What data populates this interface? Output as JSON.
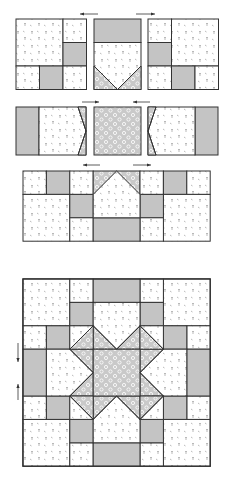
{
  "colors": {
    "background": "#ffffff",
    "line": "#333333",
    "gray_fabric": "#c4c4c4",
    "print_fabric": "#ffffff",
    "print_motif": "#8a8a8a",
    "flower_fabric": "#c9c9c9",
    "flower_motif": "#ffffff"
  },
  "fabrics": {
    "P": "background print (small sprigs on white)",
    "G": "solid gray",
    "F": "gray floral print"
  },
  "steps": [
    {
      "name": "step-1-row-units",
      "description": "Three units sewn into top section",
      "arrows": [
        "left",
        "right"
      ]
    },
    {
      "name": "step-2-middle-units",
      "description": "Three units sewn into middle row",
      "arrows": [
        "right",
        "left"
      ]
    },
    {
      "name": "step-3-joined-half",
      "description": "Units joined into a half-block section",
      "arrows": [
        "left",
        "right"
      ]
    },
    {
      "name": "step-4-finished-block",
      "description": "Finished star block",
      "arrows": [
        "down",
        "up"
      ]
    }
  ]
}
